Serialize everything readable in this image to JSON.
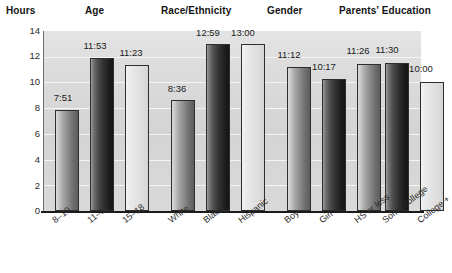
{
  "chart_data": {
    "type": "bar",
    "title": "",
    "xlabel": "",
    "ylabel": "Hours",
    "ylim": [
      0,
      14
    ],
    "ytick_labels": [
      "0",
      "2",
      "4",
      "6",
      "8",
      "10",
      "12",
      "14"
    ],
    "ytick_values": [
      0,
      2,
      4,
      6,
      8,
      10,
      12,
      14
    ],
    "grid": true,
    "legend": "none",
    "group_headers": [
      {
        "label": "Hours"
      },
      {
        "label": "Age"
      },
      {
        "label": "Race/Ethnicity"
      },
      {
        "label": "Gender"
      },
      {
        "label": "Parents' Education"
      }
    ],
    "groups": [
      {
        "name": "Age",
        "categories": [
          "8–10",
          "11–14",
          "15–18"
        ],
        "labels": [
          "7:51",
          "11:53",
          "11:23"
        ],
        "values": [
          7.85,
          11.88,
          11.38
        ]
      },
      {
        "name": "Race/Ethnicity",
        "categories": [
          "White",
          "Black",
          "Hispanic"
        ],
        "labels": [
          "8:36",
          "12:59",
          "13:00"
        ],
        "values": [
          8.6,
          12.98,
          13.0
        ]
      },
      {
        "name": "Gender",
        "categories": [
          "Boy",
          "Girl"
        ],
        "labels": [
          "11:12",
          "10:17"
        ],
        "values": [
          11.2,
          10.28
        ]
      },
      {
        "name": "Parents' Education",
        "categories": [
          "HS or less",
          "Some college",
          "College +"
        ],
        "labels": [
          "11:26",
          "11:30",
          "10:00"
        ],
        "values": [
          11.43,
          11.5,
          10.0
        ]
      }
    ],
    "categories": [
      "8–10",
      "11–14",
      "15–18",
      "White",
      "Black",
      "Hispanic",
      "Boy",
      "Girl",
      "HS or less",
      "Some college",
      "College +"
    ],
    "values": [
      7.85,
      11.88,
      11.38,
      8.6,
      12.98,
      13.0,
      11.2,
      10.28,
      11.43,
      11.5,
      10.0
    ],
    "value_labels": [
      "7:51",
      "11:53",
      "11:23",
      "8:36",
      "12:59",
      "13:00",
      "11:12",
      "10:17",
      "11:26",
      "11:30",
      "10:00"
    ],
    "bar_tones": [
      "med",
      "dark",
      "light",
      "med",
      "dark",
      "light",
      "med",
      "dark",
      "med",
      "dark",
      "light"
    ],
    "colors": {
      "plot_background": "#d6d6d6",
      "gridline": "#f4f4f4",
      "axis": "#1b1b1b",
      "bar_outline": "#2e2e2e",
      "bar_medium": "#8a8a8a",
      "bar_dark": "#333333",
      "bar_light": "#e2e2e2",
      "text": "#1a1a1a"
    }
  }
}
